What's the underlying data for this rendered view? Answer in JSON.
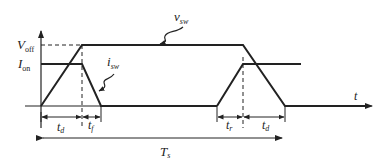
{
  "diagram": {
    "y_axis_labels": {
      "v_off": {
        "main": "V",
        "sub": "off"
      },
      "i_on": {
        "main": "I",
        "sub": "on"
      }
    },
    "x_axis_label": "t",
    "curve_labels": {
      "v_sw": {
        "main": "v",
        "sub": "sw"
      },
      "i_sw": {
        "main": "i",
        "sub": "sw"
      }
    },
    "intervals": [
      {
        "main": "t",
        "sub": "d",
        "name": "turn-off delay"
      },
      {
        "main": "t",
        "sub": "f",
        "name": "fall time"
      },
      {
        "main": "t",
        "sub": "r",
        "name": "rise time"
      },
      {
        "main": "t",
        "sub": "d",
        "name": "turn-on delay"
      }
    ],
    "period": {
      "main": "T",
      "sub": "s"
    },
    "colors": {
      "line": "#222222",
      "background": "#ffffff"
    }
  }
}
